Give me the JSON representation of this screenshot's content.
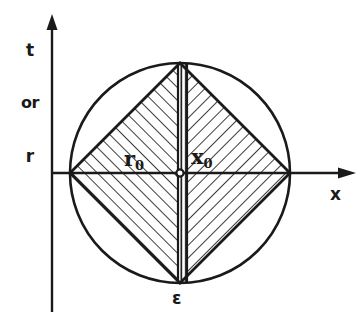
{
  "figure": {
    "background_color": "#ffffff",
    "ink_color": "#1a1a1a",
    "axes": {
      "vertical": {
        "name": "vertical-axis",
        "label_lines": [
          "t",
          "or",
          "r"
        ],
        "line_1": "t",
        "line_2": "or",
        "line_3": "r",
        "arrow": "up-arrow"
      },
      "horizontal": {
        "name": "horizontal-axis",
        "label": "x",
        "arrow": "right-arrow"
      }
    },
    "annotations": {
      "radius_label": "r",
      "radius_subscript": "0",
      "position_label": "x",
      "position_subscript": "0",
      "band_width_label": "ε"
    },
    "geometry": {
      "origin_x": 180,
      "origin_y": 173,
      "circle_radius": 110,
      "diamond_half_width": 110,
      "band_left_x": 178,
      "band_right_x": 187,
      "hatch_left_direction": "forward-slash",
      "hatch_right_direction": "back-slash",
      "hatch_band_direction": "vertical",
      "hatch_spacing": 9
    }
  }
}
